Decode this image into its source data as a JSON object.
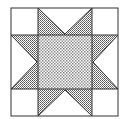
{
  "figure": {
    "type": "quilt-block",
    "pattern": "sawtooth-star",
    "colors": {
      "background": "#ffffff",
      "outline": "#333333",
      "star_points": "#9a9a9a",
      "center": "#cfcfcf"
    }
  }
}
